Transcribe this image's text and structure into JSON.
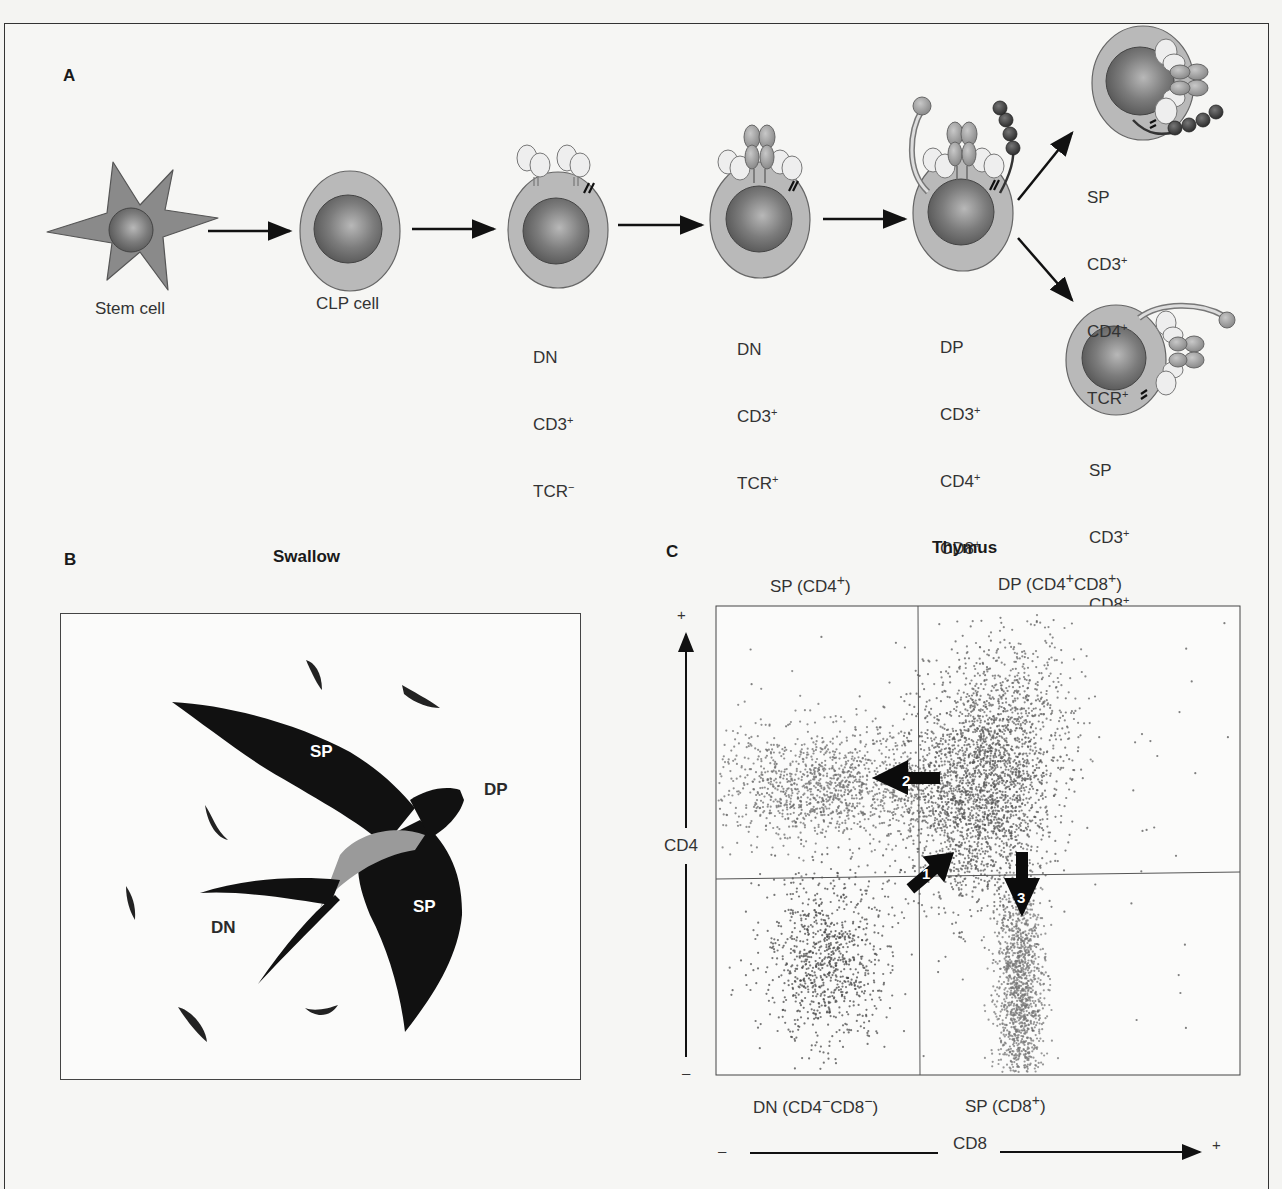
{
  "panel_a": {
    "letter": "A",
    "stages": [
      {
        "id": "stem",
        "label_lines": [
          "Stem cell"
        ]
      },
      {
        "id": "clp",
        "label_lines": [
          "CLP cell"
        ]
      },
      {
        "id": "dn1",
        "label_lines": [
          "DN",
          "CD3+",
          "TCR−"
        ]
      },
      {
        "id": "dn2",
        "label_lines": [
          "DN",
          "CD3+",
          "TCR+"
        ]
      },
      {
        "id": "dp",
        "label_lines": [
          "DP",
          "CD3+",
          "CD4+",
          "CD8+",
          "TCR+"
        ]
      },
      {
        "id": "sp4",
        "label_lines": [
          "SP",
          "CD3+",
          "CD4+",
          "TCR+"
        ]
      },
      {
        "id": "sp8",
        "label_lines": [
          "SP",
          "CD3+",
          "CD8+",
          "TCR+"
        ]
      }
    ]
  },
  "panel_b": {
    "letter": "B",
    "title": "Swallow",
    "labels": {
      "sp_upper": "SP",
      "sp_lower": "SP",
      "dp": "DP",
      "dn": "DN"
    }
  },
  "panel_c": {
    "letter": "C",
    "title": "Thymus",
    "quadrants": {
      "top_left": "SP (CD4+)",
      "top_right": "DP (CD4+CD8+)",
      "bottom_left": "DN (CD4−CD8−)",
      "bottom_right": "SP (CD8+)"
    },
    "y_axis": {
      "label": "CD4",
      "plus": "+",
      "minus": "–"
    },
    "x_axis": {
      "label": "CD8",
      "plus": "+",
      "minus": "–"
    },
    "arrows": [
      {
        "number": "1",
        "direction": "DN to DP"
      },
      {
        "number": "2",
        "direction": "DP to SP CD4"
      },
      {
        "number": "3",
        "direction": "DP to SP CD8"
      }
    ]
  },
  "chart_data": {
    "type": "scatter",
    "title": "Thymus",
    "xlabel": "CD8",
    "ylabel": "CD4",
    "quadrant_labels": [
      "SP (CD4+)",
      "DP (CD4+CD8+)",
      "DN (CD4−CD8−)",
      "SP (CD8+)"
    ],
    "axis_range": {
      "x": [
        "–",
        "+"
      ],
      "y": [
        "–",
        "+"
      ]
    },
    "quadrant_gate": {
      "x": 0.385,
      "y": 0.57
    },
    "clusters": [
      {
        "name": "SP CD4+",
        "cx": 0.22,
        "cy": 0.38,
        "sx": 0.13,
        "sy": 0.06,
        "n": 1400,
        "color": "#6e6e6e"
      },
      {
        "name": "DP",
        "cx": 0.5,
        "cy": 0.4,
        "sx": 0.07,
        "sy": 0.12,
        "n": 2200,
        "color": "#5a5a5a"
      },
      {
        "name": "DP upper tail",
        "cx": 0.57,
        "cy": 0.22,
        "sx": 0.06,
        "sy": 0.08,
        "n": 500,
        "color": "#666"
      },
      {
        "name": "DN",
        "cx": 0.21,
        "cy": 0.75,
        "sx": 0.06,
        "sy": 0.09,
        "n": 900,
        "color": "#4a4a4a"
      },
      {
        "name": "SP CD8+",
        "cx": 0.58,
        "cy": 0.82,
        "sx": 0.022,
        "sy": 0.12,
        "n": 1300,
        "color": "#777"
      },
      {
        "name": "background",
        "cx": 0.4,
        "cy": 0.5,
        "sx": 0.35,
        "sy": 0.35,
        "n": 120,
        "color": "#555"
      }
    ],
    "grid": false,
    "legend": "none"
  }
}
